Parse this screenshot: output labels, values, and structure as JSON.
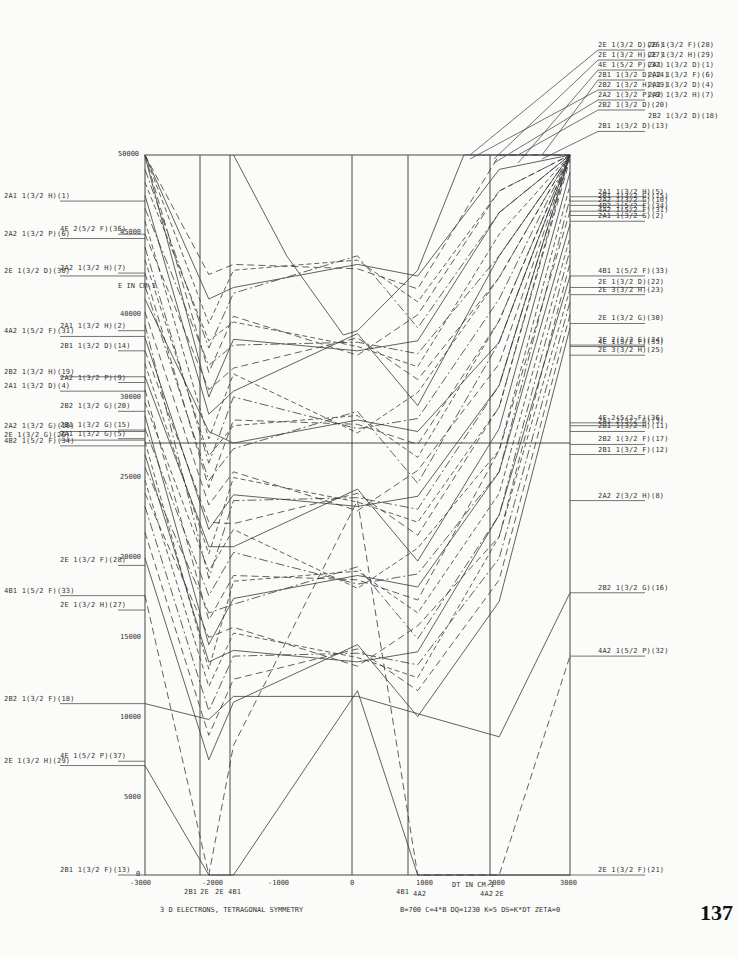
{
  "chart_data": {
    "type": "line",
    "title": "3 D ELECTRONS, TETRAGONAL SYMMETRY",
    "subtitle": "B=700  C=4*B  DQ=1230  K=5  DS=K*DT  ZETA=0",
    "xlabel": "DT IN CM-1",
    "ylabel": "E IN CM-1",
    "xlim": [
      -3000,
      3000
    ],
    "ylim": [
      0,
      50000
    ],
    "x_ticks": [
      "-3000",
      "-2000",
      "-1000",
      "0",
      "1000",
      "2000",
      "3000"
    ],
    "y_ticks": [
      "0",
      "5000",
      "10000",
      "15000",
      "20000",
      "25000",
      "30000",
      "35000",
      "40000",
      "45000",
      "50000"
    ],
    "grid_vertical_x": [
      -2000,
      -1750,
      -1000,
      0,
      1000,
      2000
    ],
    "grid_horizontal_y": [
      30000
    ],
    "ground_state_crossings": [
      {
        "x": -2100,
        "labels": [
          "2B1",
          "2E"
        ]
      },
      {
        "x": -1750,
        "labels": [
          "2E",
          "4B1"
        ]
      },
      {
        "x": 850,
        "labels": [
          "4B1",
          "4A2"
        ]
      },
      {
        "x": 2000,
        "labels": [
          "4A2",
          "2E"
        ]
      }
    ],
    "left_labels": [
      {
        "text": "2A1 1(3/2 H)(1)",
        "y": 46800
      },
      {
        "text": "4E 2(5/2 F)(36)",
        "y": 44500
      },
      {
        "text": "2A2 1(3/2 P)(6)",
        "y": 44200
      },
      {
        "text": "2A2 1(3/2 H)(7)",
        "y": 41800
      },
      {
        "text": "2E 1(3/2 D)(30)",
        "y": 41600
      },
      {
        "text": "2A1 1(3/2 H)(2)",
        "y": 37800
      },
      {
        "text": "4A2 1(5/2 F)(31)",
        "y": 37400
      },
      {
        "text": "2B1 1(3/2 D)(14)",
        "y": 36400
      },
      {
        "text": "2B2 1(3/2 H)(19)",
        "y": 34600
      },
      {
        "text": "2A2 1(3/2 P)(9)",
        "y": 34200
      },
      {
        "text": "2A1 1(3/2 D)(4)",
        "y": 33600
      },
      {
        "text": "2B2 1(3/2 G)(20)",
        "y": 32200
      },
      {
        "text": "2A2 1(3/2 G)(10)",
        "y": 30800
      },
      {
        "text": "2B1 1(3/2 G)(15)",
        "y": 30900
      },
      {
        "text": "2E 1(3/2 G)(26)",
        "y": 30200
      },
      {
        "text": "2A1 1(3/2 G)(5)",
        "y": 30300
      },
      {
        "text": "4B2 1(5/2 F)(34)",
        "y": 29800
      },
      {
        "text": "2E 1(3/2 F)(28)",
        "y": 21500
      },
      {
        "text": "4B1 1(5/2 F)(33)",
        "y": 19400
      },
      {
        "text": "2E 1(3/2 H)(27)",
        "y": 18400
      },
      {
        "text": "2B2 1(3/2 F)(18)",
        "y": 11900
      },
      {
        "text": "4E 1(5/2 P)(37)",
        "y": 7900
      },
      {
        "text": "2E 1(3/2 H)(29)",
        "y": 7600
      },
      {
        "text": "2B1 1(3/2 F)(13)",
        "y": 0
      }
    ],
    "right_labels": [
      {
        "text": "2E 1(3/2 D)(26)",
        "y": 60000
      },
      {
        "text": "2E 1(3/2 F)(28)",
        "y": 60000
      },
      {
        "text": "2E 1(3/2 H)(27)",
        "y": 59300
      },
      {
        "text": "2E 1(3/2 H)(29)",
        "y": 59300
      },
      {
        "text": "4E 1(5/2 P)(37)",
        "y": 58600
      },
      {
        "text": "2A1 1(3/2 D)(1)",
        "y": 58600
      },
      {
        "text": "2B1 1(3/2 D)(14)",
        "y": 57900
      },
      {
        "text": "2A2 1(3/2 F)(6)",
        "y": 57900
      },
      {
        "text": "2B2 1(3/2 H)(19)",
        "y": 57200
      },
      {
        "text": "2A1 1(3/2 D)(4)",
        "y": 57200
      },
      {
        "text": "2A2 1(3/2 P)(9)",
        "y": 56500
      },
      {
        "text": "2A2 1(3/2 H)(7)",
        "y": 56500
      },
      {
        "text": "2B2 1(3/2 D)(20)",
        "y": 55800
      },
      {
        "text": "2B2 1(3/2 D)(18)",
        "y": 55000
      },
      {
        "text": "2B1 1(3/2 D)(13)",
        "y": 54300
      },
      {
        "text": "2A1 1(3/2 H)(5)",
        "y": 47100
      },
      {
        "text": "2B1 1(3/2 G)(15)",
        "y": 46800
      },
      {
        "text": "2A2 1(3/2 G)(10)",
        "y": 46500
      },
      {
        "text": "4B2 1(5/2 F)(34)",
        "y": 46100
      },
      {
        "text": "4A2 1(5/2 F)(31)",
        "y": 45800
      },
      {
        "text": "2A1 1(3/2 G)(2)",
        "y": 45400
      },
      {
        "text": "4B1 1(5/2 F)(33)",
        "y": 41600
      },
      {
        "text": "2E 1(3/2 D)(22)",
        "y": 40800
      },
      {
        "text": "2E 3(3/2 H)(23)",
        "y": 40300
      },
      {
        "text": "2E 1(3/2 G)(30)",
        "y": 38300
      },
      {
        "text": "2E 2(3/2 G)(24)",
        "y": 36800
      },
      {
        "text": "4E 1(5/2 F)(35)",
        "y": 36700
      },
      {
        "text": "2E 3(3/2 H)(25)",
        "y": 36100
      },
      {
        "text": "4E 2(5/2 F)(36)",
        "y": 31400
      },
      {
        "text": "2A1 2(3/2 G)(3)",
        "y": 31200
      },
      {
        "text": "2B1 1(3/2 H)(11)",
        "y": 30800
      },
      {
        "text": "2B2 1(3/2 F)(17)",
        "y": 29900
      },
      {
        "text": "2B1 1(3/2 F)(12)",
        "y": 29200
      },
      {
        "text": "2A2 2(3/2 H)(8)",
        "y": 26000
      },
      {
        "text": "2B2 1(3/2 G)(16)",
        "y": 19600
      },
      {
        "text": "4A2 1(5/2 P)(32)",
        "y": 15200
      },
      {
        "text": "2E 1(3/2 F)(21)",
        "y": 0
      }
    ],
    "series_sample": [
      {
        "name": "2B1 ground (13)",
        "style": "solid",
        "x": [
          -3000,
          -2100,
          -1750,
          0,
          850,
          2000,
          3000
        ],
        "y": [
          7600,
          0,
          0,
          12800,
          0,
          0,
          0
        ]
      },
      {
        "name": "2B2 1(3/2 F)(18)",
        "style": "solid",
        "x": [
          -3000,
          -2100,
          -1750,
          -1000,
          0,
          850,
          2000,
          3000
        ],
        "y": [
          11900,
          10800,
          12400,
          12400,
          12400,
          11200,
          9600,
          19600
        ]
      },
      {
        "name": "4A2 branch",
        "style": "dashed",
        "x": [
          -3000,
          -2100,
          -1750,
          0,
          850,
          2000,
          3000
        ],
        "y": [
          19400,
          0,
          9000,
          26000,
          0,
          0,
          15200
        ]
      },
      {
        "name": "curved solid (center min)",
        "style": "solid",
        "x": [
          -1750,
          -1000,
          -200,
          0,
          850,
          1500,
          2000,
          3000
        ],
        "y": [
          50000,
          43000,
          37500,
          37800,
          42000,
          50000,
          50000,
          50000
        ]
      }
    ]
  },
  "axes": {
    "x_tick_labels": [
      "-3000",
      "-2000",
      "-1000",
      "0",
      "1000",
      "2000",
      "3000"
    ],
    "y_tick_labels": [
      "50000",
      "45000",
      "40000",
      "35000",
      "30000",
      "25000",
      "20000",
      "15000",
      "10000",
      "5000",
      "0"
    ],
    "y_unit_label": "E IN CM-1",
    "x_unit_label": "DT IN CM-1"
  },
  "bottom_state_labels": [
    "2B1",
    "2E",
    "2E",
    "4B1",
    "4B1",
    "4A2",
    "4A2",
    "2E"
  ],
  "captions": {
    "left": "3 D ELECTRONS, TETRAGONAL SYMMETRY",
    "right": "B=700   C=4*B   DQ=1230   K=5   DS=K*DT   ZETA=0"
  },
  "page_number": "137"
}
